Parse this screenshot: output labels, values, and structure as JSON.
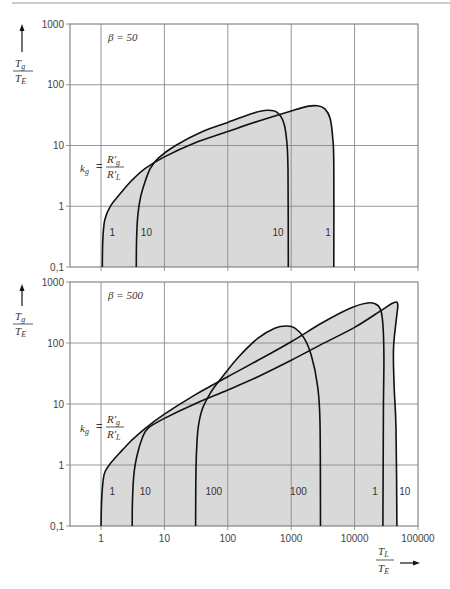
{
  "header": {
    "rule_color": "#9a9a9a"
  },
  "colors": {
    "fill": "#d9d9d9",
    "curve": "#111111",
    "grid": "#8a8a8a"
  },
  "y_axis_label": {
    "numerator": "T",
    "numerator_sub": "g",
    "denominator": "T",
    "denominator_sub": "E"
  },
  "x_axis_label": {
    "numerator": "T",
    "numerator_sub": "L",
    "denominator": "T",
    "denominator_sub": "E"
  },
  "kg_label": {
    "k": "k",
    "k_sub": "g",
    "equals": "=",
    "num": "R'",
    "num_sub": "g",
    "den": "R'",
    "den_sub": "L"
  },
  "chart_data": [
    {
      "type": "line",
      "title": "β = 50",
      "xlabel": "T_L / T_E",
      "ylabel": "T_g / T_E",
      "xscale": "log",
      "yscale": "log",
      "xlim": [
        0.32,
        100000
      ],
      "ylim": [
        0.1,
        1000
      ],
      "grid": true,
      "x_ticks": [
        "1",
        "10",
        "100",
        "1000",
        "10000",
        "100000"
      ],
      "x_tick_values": [
        1,
        10,
        100,
        1000,
        10000,
        100000
      ],
      "x_tick_labels_shown": false,
      "y_ticks": [
        "1000",
        "100",
        "10",
        "1",
        "0,1"
      ],
      "y_tick_values": [
        1000,
        100,
        10,
        1,
        0.1
      ],
      "annotation": "k_g = R'_g / R'_L",
      "series": [
        {
          "name": "k_g = 1",
          "points": [
            [
              1.05,
              0.1
            ],
            [
              1.07,
              0.3
            ],
            [
              1.15,
              0.6
            ],
            [
              1.4,
              1.0
            ],
            [
              2.0,
              1.6
            ],
            [
              3.0,
              2.6
            ],
            [
              5,
              4.2
            ],
            [
              10,
              6.5
            ],
            [
              30,
              11
            ],
            [
              100,
              17
            ],
            [
              300,
              25
            ],
            [
              1000,
              37
            ],
            [
              1800,
              44
            ],
            [
              2600,
              45
            ],
            [
              3400,
              40
            ],
            [
              4100,
              28
            ],
            [
              4500,
              14
            ],
            [
              4700,
              5
            ],
            [
              4700,
              0.1
            ]
          ],
          "labels": [
            {
              "text": "1",
              "x": 1.5,
              "y": 0.32
            },
            {
              "text": "1",
              "x": 3800,
              "y": 0.32
            }
          ]
        },
        {
          "name": "k_g = 10",
          "points": [
            [
              3.6,
              0.1
            ],
            [
              3.65,
              0.3
            ],
            [
              3.8,
              0.7
            ],
            [
              4.2,
              1.4
            ],
            [
              5,
              2.6
            ],
            [
              6,
              4.2
            ],
            [
              8,
              6.2
            ],
            [
              15,
              10
            ],
            [
              40,
              17
            ],
            [
              100,
              24
            ],
            [
              250,
              34
            ],
            [
              420,
              38
            ],
            [
              600,
              35
            ],
            [
              760,
              24
            ],
            [
              850,
              12
            ],
            [
              890,
              4
            ],
            [
              900,
              0.1
            ]
          ],
          "labels": [
            {
              "text": "10",
              "x": 5.2,
              "y": 0.32
            },
            {
              "text": "10",
              "x": 620,
              "y": 0.32
            }
          ]
        }
      ]
    },
    {
      "type": "line",
      "title": "β = 500",
      "xlabel": "T_L / T_E",
      "ylabel": "T_g / T_E",
      "xscale": "log",
      "yscale": "log",
      "xlim": [
        0.32,
        100000
      ],
      "ylim": [
        0.1,
        1000
      ],
      "grid": true,
      "x_ticks": [
        "1",
        "10",
        "100",
        "1000",
        "10000",
        "100000"
      ],
      "x_tick_values": [
        1,
        10,
        100,
        1000,
        10000,
        100000
      ],
      "x_tick_labels_shown": true,
      "y_ticks": [
        "1000",
        "100",
        "10",
        "1",
        "0,1"
      ],
      "y_tick_values": [
        1000,
        100,
        10,
        1,
        0.1
      ],
      "annotation": "k_g = R'_g / R'_L",
      "series": [
        {
          "name": "k_g = 1",
          "points": [
            [
              1.0,
              0.1
            ],
            [
              1.03,
              0.3
            ],
            [
              1.12,
              0.7
            ],
            [
              1.35,
              1.0
            ],
            [
              2.0,
              1.6
            ],
            [
              3.0,
              2.5
            ],
            [
              5.0,
              4.0
            ],
            [
              10,
              6.8
            ],
            [
              30,
              14
            ],
            [
              100,
              28
            ],
            [
              300,
              52
            ],
            [
              1000,
              105
            ],
            [
              3000,
              210
            ],
            [
              8000,
              360
            ],
            [
              15000,
              450
            ],
            [
              21000,
              440
            ],
            [
              25500,
              360
            ],
            [
              28000,
              200
            ],
            [
              29000,
              60
            ],
            [
              28500,
              8
            ],
            [
              28000,
              0.1
            ]
          ],
          "labels": [
            {
              "text": "1",
              "x": 1.5,
              "y": 0.32
            },
            {
              "text": "1",
              "x": 21000,
              "y": 0.32
            }
          ]
        },
        {
          "name": "k_g = 10",
          "points": [
            [
              3.1,
              0.1
            ],
            [
              3.15,
              0.3
            ],
            [
              3.35,
              0.8
            ],
            [
              3.8,
              1.6
            ],
            [
              4.5,
              2.8
            ],
            [
              5.5,
              4.0
            ],
            [
              10,
              5.8
            ],
            [
              30,
              10
            ],
            [
              100,
              17
            ],
            [
              300,
              28
            ],
            [
              1000,
              52
            ],
            [
              3000,
              95
            ],
            [
              10000,
              180
            ],
            [
              25000,
              330
            ],
            [
              38000,
              440
            ],
            [
              46000,
              470
            ],
            [
              48000,
              400
            ],
            [
              45000,
              220
            ],
            [
              41000,
              80
            ],
            [
              42000,
              20
            ],
            [
              45000,
              4
            ],
            [
              46500,
              0.1
            ]
          ],
          "labels": [
            {
              "text": "10",
              "x": 5.0,
              "y": 0.32
            },
            {
              "text": "10",
              "x": 62000,
              "y": 0.32
            }
          ]
        },
        {
          "name": "k_g = 100",
          "points": [
            [
              31,
              0.1
            ],
            [
              31.3,
              0.5
            ],
            [
              32,
              1.5
            ],
            [
              34,
              4
            ],
            [
              40,
              8.5
            ],
            [
              55,
              16
            ],
            [
              80,
              27
            ],
            [
              150,
              60
            ],
            [
              300,
              120
            ],
            [
              550,
              175
            ],
            [
              850,
              190
            ],
            [
              1150,
              175
            ],
            [
              1600,
              120
            ],
            [
              2100,
              60
            ],
            [
              2600,
              20
            ],
            [
              2850,
              5
            ],
            [
              2900,
              0.1
            ]
          ],
          "labels": [
            {
              "text": "100",
              "x": 60,
              "y": 0.32
            },
            {
              "text": "100",
              "x": 1300,
              "y": 0.32
            }
          ]
        }
      ]
    }
  ]
}
